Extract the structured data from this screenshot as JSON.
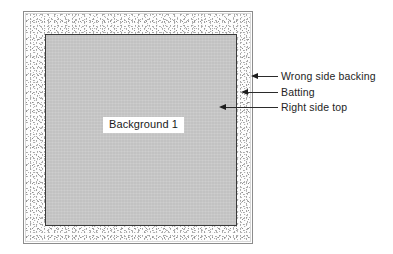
{
  "diagram": {
    "background_color": "#ffffff",
    "layers": {
      "backing": {
        "name": "Wrong side backing",
        "fill": "#ffffff",
        "border_color": "#8c8c8c"
      },
      "batting": {
        "name": "Batting",
        "fill": "#fdfdfd",
        "texture": "speckle"
      },
      "top": {
        "name": "Right side top",
        "fill": "#c9c9c9",
        "border_color": "#3a3a3a"
      }
    },
    "caption": {
      "text": "Background 1",
      "box_fill": "#ffffff",
      "text_color": "#1a1a1a"
    },
    "callouts": [
      {
        "label": "Wrong side backing",
        "target": "backing"
      },
      {
        "label": "Batting",
        "target": "batting"
      },
      {
        "label": "Right side top",
        "target": "top"
      }
    ]
  }
}
